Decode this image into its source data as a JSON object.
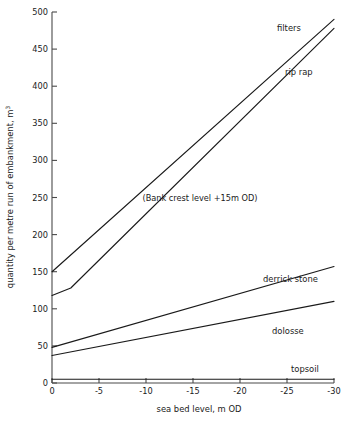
{
  "chart_data": {
    "type": "line",
    "title": "",
    "xlabel": "sea bed level, m OD",
    "ylabel": "quantity per metre run of embankment, m",
    "ylabel_superscript": "3",
    "xlim": [
      0,
      -30
    ],
    "ylim": [
      0,
      500
    ],
    "xticks": [
      "0",
      "-5",
      "-10",
      "-15",
      "-20",
      "-25",
      "-30"
    ],
    "xtick_values": [
      0,
      -5,
      -10,
      -15,
      -20,
      -25,
      -30
    ],
    "yticks": [
      "0",
      "50",
      "100",
      "150",
      "200",
      "250",
      "300",
      "350",
      "400",
      "450",
      "500"
    ],
    "ytick_values": [
      0,
      50,
      100,
      150,
      200,
      250,
      300,
      350,
      400,
      450,
      500
    ],
    "grid": false,
    "legend_position": "inline-right-of-curves",
    "annotations": [
      {
        "text": "(Bank crest level +15m OD)",
        "x": -17.5,
        "y": 232
      }
    ],
    "series": [
      {
        "name": "filters",
        "label": "filters",
        "label_x": -25.4,
        "label_y": 468,
        "x": [
          0,
          -30
        ],
        "y": [
          150,
          490
        ]
      },
      {
        "name": "rip rap",
        "label": "rip rap",
        "label_x": -24.6,
        "label_y": 417,
        "x": [
          0,
          -2,
          -30
        ],
        "y": [
          118,
          128,
          478
        ]
      },
      {
        "name": "derrick stone",
        "label": "derrick stone",
        "label_x": -22.2,
        "label_y": 168,
        "x": [
          0,
          -30
        ],
        "y": [
          48,
          157
        ]
      },
      {
        "name": "dolosse",
        "label": "dolosse",
        "label_x": -23.3,
        "label_y": 98,
        "x": [
          0,
          -30
        ],
        "y": [
          37,
          110
        ]
      },
      {
        "name": "topsoil",
        "label": "topsoil",
        "label_x": -26.6,
        "label_y": 22,
        "x": [
          0,
          -30
        ],
        "y": [
          5,
          5
        ]
      }
    ]
  }
}
